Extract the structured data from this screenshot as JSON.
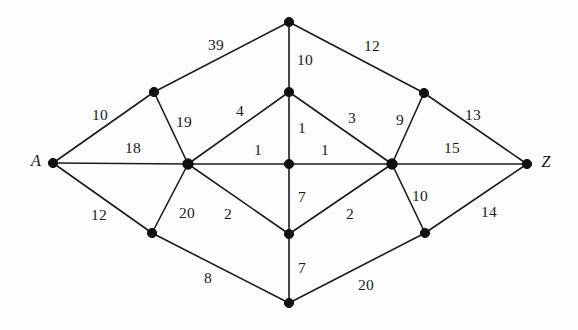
{
  "figure": {
    "type": "weighted-undirected-graph",
    "width": 578,
    "height": 330,
    "background_color": "#fdfdfd",
    "edge_color": "#1b1b1b",
    "node_color": "#111111",
    "label_color": "#1a1a1a"
  },
  "chart_data": {
    "type": "diagram",
    "title": "",
    "xlabel": "",
    "ylabel": "",
    "nodes": [
      {
        "id": "A",
        "label": "A",
        "x": 53,
        "y": 163,
        "label_x": 36,
        "label_y": 161,
        "radius": 4.6
      },
      {
        "id": "Z",
        "label": "Z",
        "x": 527,
        "y": 164,
        "label_x": 546,
        "label_y": 162,
        "radius": 4.6
      },
      {
        "id": "T",
        "label": "",
        "x": 289,
        "y": 22,
        "radius": 4.6
      },
      {
        "id": "UL",
        "label": "",
        "x": 154,
        "y": 92,
        "radius": 4.6
      },
      {
        "id": "UM",
        "label": "",
        "x": 289,
        "y": 92,
        "radius": 4.6
      },
      {
        "id": "UR",
        "label": "",
        "x": 424,
        "y": 93,
        "radius": 4.6
      },
      {
        "id": "ML",
        "label": "",
        "x": 188,
        "y": 164,
        "radius": 5.2
      },
      {
        "id": "MC",
        "label": "",
        "x": 289,
        "y": 164,
        "radius": 4.6
      },
      {
        "id": "MR",
        "label": "",
        "x": 392,
        "y": 164,
        "radius": 5.2
      },
      {
        "id": "LL",
        "label": "",
        "x": 152,
        "y": 233,
        "radius": 4.6
      },
      {
        "id": "LM",
        "label": "",
        "x": 289,
        "y": 234,
        "radius": 4.6
      },
      {
        "id": "LR",
        "label": "",
        "x": 425,
        "y": 233,
        "radius": 4.6
      },
      {
        "id": "B",
        "label": "",
        "x": 289,
        "y": 303,
        "radius": 4.6
      }
    ],
    "edges": [
      {
        "from": "A",
        "to": "UL",
        "weight": "10",
        "label_x": 100,
        "label_y": 115
      },
      {
        "from": "A",
        "to": "ML",
        "weight": "18",
        "label_x": 133,
        "label_y": 148
      },
      {
        "from": "A",
        "to": "LL",
        "weight": "12",
        "label_x": 99,
        "label_y": 215
      },
      {
        "from": "UL",
        "to": "T",
        "weight": "39",
        "label_x": 216,
        "label_y": 45
      },
      {
        "from": "UL",
        "to": "ML",
        "weight": "19",
        "label_x": 184,
        "label_y": 122
      },
      {
        "from": "T",
        "to": "UM",
        "weight": "10",
        "label_x": 305,
        "label_y": 60
      },
      {
        "from": "T",
        "to": "UR",
        "weight": "12",
        "label_x": 372,
        "label_y": 46
      },
      {
        "from": "ML",
        "to": "UM",
        "weight": "4",
        "label_x": 240,
        "label_y": 111
      },
      {
        "from": "ML",
        "to": "MC",
        "weight": "1",
        "label_x": 258,
        "label_y": 150
      },
      {
        "from": "ML",
        "to": "LL",
        "weight": "20",
        "label_x": 187,
        "label_y": 213
      },
      {
        "from": "ML",
        "to": "LM",
        "weight": "2",
        "label_x": 228,
        "label_y": 214
      },
      {
        "from": "UM",
        "to": "MC",
        "weight": "1",
        "label_x": 302,
        "label_y": 128
      },
      {
        "from": "UM",
        "to": "MR",
        "weight": "3",
        "label_x": 352,
        "label_y": 118
      },
      {
        "from": "UR",
        "to": "MR",
        "weight": "9",
        "label_x": 400,
        "label_y": 120
      },
      {
        "from": "UR",
        "to": "Z",
        "weight": "13",
        "label_x": 473,
        "label_y": 115
      },
      {
        "from": "MC",
        "to": "MR",
        "weight": "1",
        "label_x": 325,
        "label_y": 150
      },
      {
        "from": "MC",
        "to": "LM",
        "weight": "7",
        "label_x": 302,
        "label_y": 197
      },
      {
        "from": "MR",
        "to": "Z",
        "weight": "15",
        "label_x": 452,
        "label_y": 148
      },
      {
        "from": "MR",
        "to": "LM",
        "weight": "2",
        "label_x": 350,
        "label_y": 214
      },
      {
        "from": "MR",
        "to": "LR",
        "weight": "10",
        "label_x": 420,
        "label_y": 196
      },
      {
        "from": "LL",
        "to": "B",
        "weight": "8",
        "label_x": 208,
        "label_y": 278
      },
      {
        "from": "LM",
        "to": "B",
        "weight": "7",
        "label_x": 302,
        "label_y": 268
      },
      {
        "from": "LR",
        "to": "Z",
        "weight": "14",
        "label_x": 489,
        "label_y": 212
      },
      {
        "from": "LR",
        "to": "B",
        "weight": "20",
        "label_x": 366,
        "label_y": 285
      }
    ]
  }
}
